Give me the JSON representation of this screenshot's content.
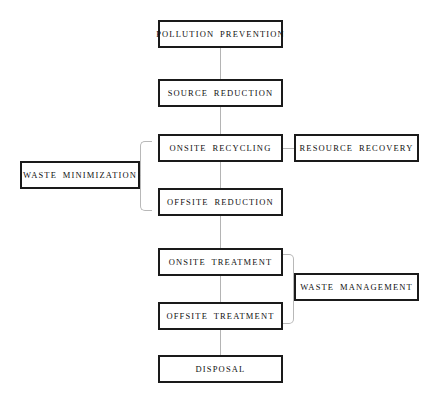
{
  "diagram": {
    "type": "flowchart",
    "title": "",
    "nodes": [
      {
        "id": "pollution_prevention",
        "label": "POLLUTION  PREVENTION",
        "x": 158,
        "y": 20,
        "w": 125,
        "h": 28
      },
      {
        "id": "source_reduction",
        "label": "SOURCE  REDUCTION",
        "x": 158,
        "y": 79,
        "w": 125,
        "h": 28
      },
      {
        "id": "onsite_recycling",
        "label": "ONSITE  RECYCLING",
        "x": 158,
        "y": 134,
        "w": 125,
        "h": 28
      },
      {
        "id": "resource_recovery",
        "label": "RESOURCE  RECOVERY",
        "x": 294,
        "y": 134,
        "w": 125,
        "h": 28
      },
      {
        "id": "waste_minimization",
        "label": "WASTE  MINIMIZATION",
        "x": 20,
        "y": 161,
        "w": 120,
        "h": 28
      },
      {
        "id": "offsite_reduction",
        "label": "OFFSITE  REDUCTION",
        "x": 158,
        "y": 188,
        "w": 125,
        "h": 28
      },
      {
        "id": "onsite_treatment",
        "label": "ONSITE  TREATMENT",
        "x": 158,
        "y": 248,
        "w": 125,
        "h": 28
      },
      {
        "id": "waste_management",
        "label": "WASTE  MANAGEMENT",
        "x": 294,
        "y": 273,
        "w": 125,
        "h": 28
      },
      {
        "id": "offsite_treatment",
        "label": "OFFSITE  TREATMENT",
        "x": 158,
        "y": 302,
        "w": 125,
        "h": 28
      },
      {
        "id": "disposal",
        "label": "DISPOSAL",
        "x": 158,
        "y": 355,
        "w": 125,
        "h": 28
      }
    ],
    "connectors": [
      {
        "id": "pp-to-sr",
        "from": "pollution_prevention",
        "to": "source_reduction",
        "orient": "vertical",
        "x": 220,
        "y": 48,
        "len": 31
      },
      {
        "id": "sr-to-or",
        "from": "source_reduction",
        "to": "onsite_recycling",
        "orient": "vertical",
        "x": 220,
        "y": 107,
        "len": 27
      },
      {
        "id": "or-to-ofr",
        "from": "onsite_recycling",
        "to": "offsite_reduction",
        "orient": "vertical",
        "x": 220,
        "y": 162,
        "len": 26
      },
      {
        "id": "ofr-to-ot",
        "from": "offsite_reduction",
        "to": "onsite_treatment",
        "orient": "vertical",
        "x": 220,
        "y": 216,
        "len": 32
      },
      {
        "id": "ot-to-oft",
        "from": "onsite_treatment",
        "to": "offsite_treatment",
        "orient": "vertical",
        "x": 220,
        "y": 276,
        "len": 26
      },
      {
        "id": "oft-to-ds",
        "from": "offsite_treatment",
        "to": "disposal",
        "orient": "vertical",
        "x": 220,
        "y": 330,
        "len": 25
      },
      {
        "id": "or-to-rr",
        "from": "onsite_recycling",
        "to": "resource_recovery",
        "orient": "horizontal",
        "x": 283,
        "y": 148,
        "len": 11
      }
    ],
    "brackets": [
      {
        "id": "waste-minimization-bracket",
        "side": "left",
        "x": 140,
        "y": 141,
        "w": 12,
        "h": 70,
        "groups": [
          "onsite_recycling",
          "offsite_reduction"
        ],
        "labels": "waste_minimization"
      },
      {
        "id": "waste-management-bracket",
        "side": "right",
        "x": 282,
        "y": 254,
        "w": 12,
        "h": 70,
        "groups": [
          "onsite_treatment",
          "offsite_treatment"
        ],
        "labels": "waste_management"
      }
    ],
    "bracket_stems": [
      {
        "id": "waste-minimization-stem",
        "x": 133,
        "y": 175,
        "len": 7
      },
      {
        "id": "waste-management-stem",
        "x": 294,
        "y": 288,
        "len": 0
      }
    ],
    "colors": {
      "node_border": "#1a1a1a",
      "node_fill": "#ffffff",
      "text": "#111111",
      "connector": "#b4b4b4",
      "bracket": "#b8b8b8",
      "background": "#ffffff"
    }
  }
}
